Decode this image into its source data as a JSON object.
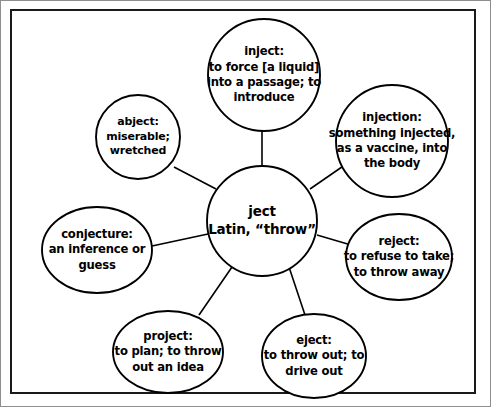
{
  "diagram": {
    "type": "word-web",
    "center": {
      "id": "root-ject",
      "lines": [
        "ject",
        "Latin, “throw”"
      ],
      "word": "ject",
      "origin": "Latin, “throw”"
    },
    "nodes": [
      {
        "id": "inject",
        "word": "inject:",
        "definition": "to force [a liquid] into a passage; to introduce",
        "lines": [
          "inject:",
          "to force [a liquid]",
          "into a passage; to",
          "introduce"
        ]
      },
      {
        "id": "injection",
        "word": "injection:",
        "definition": "something injected, as a vaccine, into the body",
        "lines": [
          "injection:",
          "something injected,",
          "as a vaccine, into",
          "the body"
        ]
      },
      {
        "id": "reject",
        "word": "reject:",
        "definition": "to refuse to take; to throw away",
        "lines": [
          "reject:",
          "to refuse to take;",
          "to throw away"
        ]
      },
      {
        "id": "eject",
        "word": "eject:",
        "definition": "to throw out; to drive out",
        "lines": [
          "eject:",
          "to throw out; to",
          "drive out"
        ]
      },
      {
        "id": "project",
        "word": "project:",
        "definition": "to plan; to throw out an idea",
        "lines": [
          "project:",
          "to plan; to throw",
          "out an idea"
        ]
      },
      {
        "id": "conjecture",
        "word": "conjecture:",
        "definition": "an inference or guess",
        "lines": [
          "conjecture:",
          "an inference or",
          "guess"
        ]
      },
      {
        "id": "abject",
        "word": "abject:",
        "definition": "miserable; wretched",
        "lines": [
          "abject:",
          "miserable;",
          "wretched"
        ]
      }
    ],
    "colors": {
      "stroke": "#000000",
      "fill": "#ffffff",
      "frame": "#1a1a1a",
      "page_edge": "#8e8e8e"
    }
  }
}
